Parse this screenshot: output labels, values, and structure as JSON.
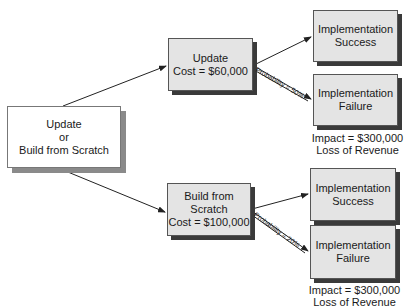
{
  "root": {
    "lines": [
      "Update",
      "or",
      "Build from Scratch"
    ]
  },
  "branches": [
    {
      "lines": [
        "Update",
        "Cost = $60,000"
      ],
      "probability": "Probability = 50%",
      "success": {
        "lines": [
          "Implementation",
          "Success"
        ]
      },
      "failure": {
        "lines": [
          "Implementation",
          "Failure"
        ]
      },
      "impact": [
        "Impact = $300,000",
        "Loss of Revenue"
      ]
    },
    {
      "lines": [
        "Build from Scratch",
        "Cost = $100,000"
      ],
      "probability": "Probability = 20%",
      "success": {
        "lines": [
          "Implementation",
          "Success"
        ]
      },
      "failure": {
        "lines": [
          "Implementation",
          "Failure"
        ]
      },
      "impact": [
        "Impact = $300,000",
        "Loss of Revenue"
      ]
    }
  ]
}
